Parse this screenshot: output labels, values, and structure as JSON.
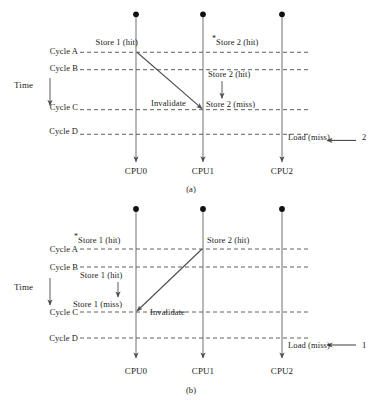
{
  "figure": {
    "type": "timing-diagram",
    "time_axis_label": "Time",
    "cpus": [
      "CPU0",
      "CPU1",
      "CPU2"
    ],
    "cycles": [
      "Cycle A",
      "Cycle B",
      "Cycle C",
      "Cycle D"
    ]
  },
  "panel_a": {
    "caption": "(a)",
    "time_label": "Time",
    "cycle_labels": [
      "Cycle A",
      "Cycle B",
      "Cycle C",
      "Cycle D"
    ],
    "cpu_labels": [
      "CPU0",
      "CPU1",
      "CPU2"
    ],
    "annotations": {
      "cpu0_store": "Store 1 (hit)",
      "cpu0_store_star": "",
      "cpu1_store_top": "Store 2 (hit)",
      "cpu1_store_top_star": "*",
      "cpu1_store_mid": "Store 2 (hit)",
      "cpu1_store_miss": "Store 2 (miss)",
      "invalidate": "Invalidate",
      "load_miss": "Load (miss)",
      "load_miss_value": "2"
    }
  },
  "panel_b": {
    "caption": "(b)",
    "time_label": "Time",
    "cycle_labels": [
      "Cycle A",
      "Cycle B",
      "Cycle C",
      "Cycle D"
    ],
    "cpu_labels": [
      "CPU0",
      "CPU1",
      "CPU2"
    ],
    "annotations": {
      "cpu0_store_top": "Store 1 (hit)",
      "cpu0_store_top_star": "*",
      "cpu1_store": "Store 2 (hit)",
      "cpu0_store_mid": "Store 1 (hit)",
      "cpu0_store_miss": "Store 1 (miss)",
      "invalidate": "Invalidate",
      "load_miss": "Load (miss)",
      "load_miss_value": "1"
    }
  },
  "colors": {
    "line": "#8a8a8a",
    "dashed": "#5a5a5a",
    "arrow": "#5a5a5a",
    "text": "#1b1b1b",
    "dot": "#111111"
  }
}
